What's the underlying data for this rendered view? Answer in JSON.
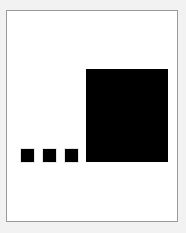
{
  "figure": {
    "canvas": {
      "width": 186,
      "height": 233,
      "background_color": "#f2f2f2"
    },
    "panel": {
      "x": 6,
      "y": 10,
      "width": 172,
      "height": 212,
      "fill_color": "#ffffff",
      "border_color": "#9a9a9a",
      "border_width": 1
    },
    "baseline_y": 162,
    "shape_color": "#000000"
  },
  "chart_data": {
    "type": "bar",
    "subtitle": "",
    "xlabel": "",
    "ylabel": "",
    "grid": false,
    "legend": "none",
    "orientation": "vertical",
    "baseline_y": 162,
    "categories": [
      "1",
      "2",
      "3",
      "4"
    ],
    "values": [
      13,
      13,
      13,
      93
    ],
    "widths": [
      13,
      13,
      13,
      82
    ],
    "series": [
      {
        "name": "square size",
        "values": [
          13,
          13,
          13,
          93
        ],
        "color": "#000000"
      }
    ],
    "shapes": [
      {
        "name": "small-square-1",
        "shape": "square",
        "x": 21,
        "y": 149,
        "width": 13,
        "height": 13,
        "color": "#000000"
      },
      {
        "name": "small-square-2",
        "shape": "square",
        "x": 43,
        "y": 149,
        "width": 13,
        "height": 13,
        "color": "#000000"
      },
      {
        "name": "small-square-3",
        "shape": "square",
        "x": 65,
        "y": 149,
        "width": 13,
        "height": 13,
        "color": "#000000"
      },
      {
        "name": "large-square",
        "shape": "square",
        "x": 86,
        "y": 69,
        "width": 82,
        "height": 93,
        "color": "#000000"
      }
    ],
    "xlim": [
      6,
      178
    ],
    "ylim": [
      10,
      222
    ]
  }
}
